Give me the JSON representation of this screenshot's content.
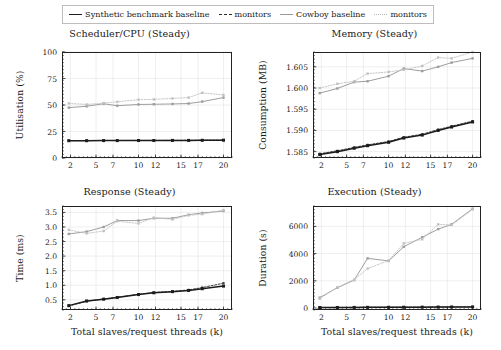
{
  "legend": {
    "position": "top-center",
    "entries": [
      {
        "label": "Synthetic benchmark baseline",
        "style": "sw-solid-dark",
        "color": "#1c1c1c"
      },
      {
        "label": "monitors",
        "style": "sw-dash-dark",
        "color": "#2a2a2a"
      },
      {
        "label": "Cowboy baseline",
        "style": "sw-solid-gray",
        "color": "#9a9a9a"
      },
      {
        "label": "monitors",
        "style": "sw-dot-gray",
        "color": "#b9b9b9"
      }
    ]
  },
  "chart_data": [
    {
      "id": "scheduler-cpu",
      "type": "line",
      "title": "Scheduler/CPU (Steady)",
      "xlabel": "",
      "ylabel": "Utilisation (%)",
      "xlim": [
        1,
        21
      ],
      "ylim": [
        0,
        100
      ],
      "xticks": [
        2,
        5,
        7,
        10,
        12,
        15,
        17,
        20
      ],
      "yticks": [
        0,
        25,
        50,
        75,
        100
      ],
      "grid": true,
      "x": [
        1.8,
        3.9,
        5.9,
        7.5,
        10,
        11.8,
        14,
        15.9,
        17.5,
        20
      ],
      "series": [
        {
          "name": "Synthetic benchmark baseline",
          "style": "solid-dark",
          "values": [
            16.3,
            16.3,
            16.4,
            16.4,
            16.5,
            16.5,
            16.6,
            16.6,
            16.7,
            16.8
          ]
        },
        {
          "name": "monitors",
          "style": "dash-dark",
          "values": [
            16.4,
            16.4,
            16.5,
            16.5,
            16.6,
            16.6,
            16.7,
            16.7,
            16.8,
            16.9
          ]
        },
        {
          "name": "Cowboy baseline",
          "style": "solid-gray",
          "values": [
            47.5,
            48.8,
            51.2,
            49.3,
            50.5,
            50.7,
            51.0,
            51.4,
            53.2,
            57.0
          ]
        },
        {
          "name": "monitors",
          "style": "dot-gray",
          "values": [
            51.5,
            50.5,
            51.8,
            53.0,
            55.0,
            55.3,
            56.2,
            57.0,
            61.5,
            59.5
          ]
        }
      ]
    },
    {
      "id": "memory",
      "type": "line",
      "title": "Memory (Steady)",
      "xlabel": "",
      "ylabel": "Consumption (MB)",
      "xlim": [
        1,
        21
      ],
      "ylim": [
        1.5835,
        1.6085
      ],
      "xticks": [
        2,
        5,
        7,
        10,
        12,
        15,
        17,
        20
      ],
      "yticks": [
        1.585,
        1.59,
        1.595,
        1.6,
        1.605
      ],
      "ytick_labels": [
        "1.585",
        "1.590",
        "1.595",
        "1.600",
        "1.605"
      ],
      "grid": true,
      "x": [
        1.8,
        3.9,
        5.9,
        7.5,
        10,
        11.8,
        14,
        15.9,
        17.5,
        20
      ],
      "series": [
        {
          "name": "Synthetic benchmark baseline",
          "style": "solid-dark",
          "values": [
            1.5843,
            1.585,
            1.5858,
            1.5864,
            1.5872,
            1.5882,
            1.5889,
            1.59,
            1.5908,
            1.592
          ]
        },
        {
          "name": "monitors",
          "style": "dash-dark",
          "values": [
            1.5845,
            1.5852,
            1.586,
            1.5866,
            1.5874,
            1.5884,
            1.5891,
            1.5902,
            1.591,
            1.5922
          ]
        },
        {
          "name": "Cowboy baseline",
          "style": "solid-gray",
          "values": [
            1.5988,
            1.5999,
            1.6014,
            1.6016,
            1.6028,
            1.6046,
            1.604,
            1.605,
            1.606,
            1.607
          ]
        },
        {
          "name": "monitors",
          "style": "dot-gray",
          "values": [
            1.6,
            1.601,
            1.6016,
            1.6034,
            1.6038,
            1.6043,
            1.6052,
            1.6072,
            1.607,
            1.6085
          ]
        }
      ]
    },
    {
      "id": "response",
      "type": "line",
      "title": "Response (Steady)",
      "xlabel": "Total slaves/request threads (k)",
      "ylabel": "Time (ms)",
      "xlim": [
        1,
        21
      ],
      "ylim": [
        0.15,
        3.72
      ],
      "xticks": [
        2,
        5,
        7,
        10,
        12,
        15,
        17,
        20
      ],
      "yticks": [
        0.5,
        1.0,
        1.5,
        2.0,
        2.5,
        3.0,
        3.5
      ],
      "ytick_labels": [
        "0.5",
        "1.0",
        "1.5",
        "2.0",
        "2.5",
        "3.0",
        "3.5"
      ],
      "grid": true,
      "x": [
        1.8,
        3.9,
        5.9,
        7.5,
        10,
        11.8,
        14,
        15.9,
        17.5,
        20
      ],
      "series": [
        {
          "name": "Synthetic benchmark baseline",
          "style": "solid-dark",
          "values": [
            0.3,
            0.46,
            0.52,
            0.58,
            0.68,
            0.74,
            0.78,
            0.82,
            0.88,
            0.97
          ]
        },
        {
          "name": "monitors",
          "style": "dash-dark",
          "values": [
            0.29,
            0.45,
            0.53,
            0.59,
            0.69,
            0.75,
            0.79,
            0.84,
            0.92,
            1.07
          ]
        },
        {
          "name": "Cowboy baseline",
          "style": "solid-gray",
          "values": [
            2.76,
            2.84,
            3.0,
            3.22,
            3.22,
            3.3,
            3.3,
            3.42,
            3.48,
            3.55
          ]
        },
        {
          "name": "monitors",
          "style": "dot-gray",
          "values": [
            2.9,
            2.78,
            2.86,
            3.2,
            3.12,
            3.32,
            3.26,
            3.4,
            3.44,
            3.58
          ]
        }
      ]
    },
    {
      "id": "execution",
      "type": "line",
      "title": "Execution (Steady)",
      "xlabel": "Total slaves/request threads (k)",
      "ylabel": "Duration (s)",
      "xlim": [
        1,
        21
      ],
      "ylim": [
        -150,
        7500
      ],
      "xticks": [
        2,
        5,
        7,
        10,
        12,
        15,
        17,
        20
      ],
      "yticks": [
        0,
        2000,
        4000,
        6000
      ],
      "ytick_labels": [
        "0",
        "2000",
        "4000",
        "6000"
      ],
      "grid": true,
      "x": [
        1.8,
        3.9,
        5.9,
        7.5,
        10,
        11.8,
        14,
        15.9,
        17.5,
        20
      ],
      "series": [
        {
          "name": "Synthetic benchmark baseline",
          "style": "solid-dark",
          "values": [
            30,
            35,
            40,
            45,
            50,
            55,
            60,
            65,
            70,
            75
          ]
        },
        {
          "name": "monitors",
          "style": "dash-dark",
          "values": [
            35,
            40,
            45,
            50,
            55,
            60,
            65,
            70,
            75,
            80
          ]
        },
        {
          "name": "Cowboy baseline",
          "style": "solid-gray",
          "values": [
            760,
            1490,
            2050,
            3650,
            3460,
            4500,
            5200,
            5800,
            6150,
            7300
          ]
        },
        {
          "name": "monitors",
          "style": "dot-gray",
          "values": [
            680,
            1520,
            2080,
            2900,
            3480,
            4750,
            5050,
            6150,
            6100,
            7250
          ]
        }
      ]
    }
  ]
}
